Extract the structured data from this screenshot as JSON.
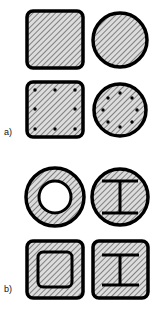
{
  "figure": {
    "type": "engineering-cross-section-diagram",
    "width": 158,
    "height": 312,
    "background_color": "#ffffff",
    "outline_color": "#000000",
    "hatch_color": "#7a7a7a",
    "hatch_background": "#d9d9d9",
    "hatch_angle_deg": 45,
    "hatch_spacing_px": 1.6,
    "rebar_dot_color": "#000000"
  },
  "panels": [
    {
      "id": "panel-a",
      "label": "a)",
      "label_x": 4,
      "label_y": 128,
      "shapes": [
        {
          "id": "plain-square-section",
          "name": "plain-square-section",
          "geometry": "rounded-square",
          "x": 27,
          "y": 11,
          "width": 56,
          "height": 57,
          "corner_radius": 6,
          "stroke_width": 3.5,
          "filled": true,
          "hatched": true,
          "rebars": 0
        },
        {
          "id": "plain-circular-section",
          "name": "plain-circular-section",
          "geometry": "circle",
          "cx": 120,
          "cy": 40,
          "r": 27,
          "stroke_width": 3.5,
          "filled": true,
          "hatched": true,
          "rebars": 0
        },
        {
          "id": "reinforced-square-section",
          "name": "reinforced-square-section",
          "geometry": "rounded-square",
          "x": 27,
          "y": 82,
          "width": 56,
          "height": 55,
          "corner_radius": 6,
          "stroke_width": 3.5,
          "filled": true,
          "hatched": true,
          "rebars": 8,
          "rebar_radius": 1.6,
          "rebar_layout": "perimeter-3x3"
        },
        {
          "id": "reinforced-circular-section",
          "name": "reinforced-circular-section",
          "geometry": "circle",
          "cx": 120,
          "cy": 110,
          "r": 26,
          "stroke_width": 3.5,
          "filled": true,
          "hatched": true,
          "rebars": 8,
          "rebar_radius": 1.6,
          "rebar_layout": "ring",
          "rebar_ring_radius": 17
        }
      ]
    },
    {
      "id": "panel-b",
      "label": "b)",
      "label_x": 4,
      "label_y": 285,
      "shapes": [
        {
          "id": "hollow-circular-section",
          "name": "hollow-circular-section",
          "geometry": "annulus",
          "cx": 55,
          "cy": 197,
          "r_outer": 29,
          "r_inner": 16,
          "stroke_width": 3.5,
          "filled": true,
          "hatched": true
        },
        {
          "id": "i-beam-in-circle-section",
          "name": "i-beam-in-circle-section",
          "geometry": "circle-with-i-beam",
          "cx": 120,
          "cy": 197,
          "r": 28,
          "stroke_width": 3.5,
          "filled": true,
          "hatched": true,
          "ibeam": {
            "flange_half_width": 18,
            "flange_top_y": -16,
            "flange_bottom_y": 16,
            "web_half_width": 3,
            "line_width": 3.0
          }
        },
        {
          "id": "hollow-square-section",
          "name": "hollow-square-section",
          "geometry": "rounded-square-with-inner-square",
          "x": 27,
          "y": 241,
          "width": 56,
          "height": 57,
          "corner_radius": 6,
          "stroke_width": 3.5,
          "inner_inset": 10,
          "inner_corner_radius": 5,
          "inner_stroke_width": 3.0,
          "filled": true,
          "hatched": true
        },
        {
          "id": "i-beam-in-square-section",
          "name": "i-beam-in-square-section",
          "geometry": "rounded-square-with-i-beam",
          "x": 93,
          "y": 241,
          "width": 55,
          "height": 57,
          "corner_radius": 6,
          "stroke_width": 3.5,
          "filled": true,
          "hatched": true,
          "ibeam": {
            "flange_half_width": 18,
            "flange_top_y": -16,
            "flange_bottom_y": 16,
            "web_half_width": 3,
            "line_width": 3.0
          }
        }
      ]
    }
  ]
}
